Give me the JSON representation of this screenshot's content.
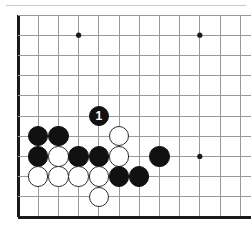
{
  "figure": {
    "kind": "go-board-diagram",
    "width": 251,
    "height": 236,
    "background_color": "#ffffff",
    "top_rule_color": "#c9c9c9"
  },
  "board": {
    "description": "Lower-left corner of a Go board showing a joseki sequence with move 1 marked",
    "origin_x": 18,
    "origin_y": 15,
    "spacing": 20.2,
    "columns": 12,
    "rows": 11,
    "line_color": "#9a9a9a",
    "edge_color": "#1a1a1a",
    "edge_width": 3,
    "line_width": 1,
    "left_edge_column": 0,
    "bottom_edge_row": 10,
    "star_point_color": "#1a1a1a",
    "star_point_radius": 2.6,
    "star_points": [
      {
        "col": 3,
        "row": 1
      },
      {
        "col": 9,
        "row": 1
      },
      {
        "col": 9,
        "row": 7
      }
    ]
  },
  "stones": {
    "radius": 10.2,
    "black_color": "#111111",
    "white_color": "#ffffff",
    "white_outline_color": "#2b2b2b",
    "items": [
      {
        "col": 4,
        "row": 5,
        "color": "black",
        "label": "1",
        "name": "stone-black-move-1"
      },
      {
        "col": 1,
        "row": 6,
        "color": "black",
        "label": "",
        "name": "stone-black-c6"
      },
      {
        "col": 2,
        "row": 6,
        "color": "black",
        "label": "",
        "name": "stone-black-c6b"
      },
      {
        "col": 5,
        "row": 6,
        "color": "white",
        "label": "",
        "name": "stone-white-f6"
      },
      {
        "col": 1,
        "row": 7,
        "color": "black",
        "label": "",
        "name": "stone-black-b7"
      },
      {
        "col": 2,
        "row": 7,
        "color": "white",
        "label": "",
        "name": "stone-white-c7"
      },
      {
        "col": 3,
        "row": 7,
        "color": "black",
        "label": "",
        "name": "stone-black-d7"
      },
      {
        "col": 4,
        "row": 7,
        "color": "black",
        "label": "",
        "name": "stone-black-e7"
      },
      {
        "col": 5,
        "row": 7,
        "color": "white",
        "label": "",
        "name": "stone-white-f7"
      },
      {
        "col": 7,
        "row": 7,
        "color": "black",
        "label": "",
        "name": "stone-black-h7"
      },
      {
        "col": 1,
        "row": 8,
        "color": "white",
        "label": "",
        "name": "stone-white-b8"
      },
      {
        "col": 2,
        "row": 8,
        "color": "white",
        "label": "",
        "name": "stone-white-c8"
      },
      {
        "col": 3,
        "row": 8,
        "color": "white",
        "label": "",
        "name": "stone-white-d8"
      },
      {
        "col": 4,
        "row": 8,
        "color": "white",
        "label": "",
        "name": "stone-white-e8"
      },
      {
        "col": 5,
        "row": 8,
        "color": "black",
        "label": "",
        "name": "stone-black-f8"
      },
      {
        "col": 6,
        "row": 8,
        "color": "black",
        "label": "",
        "name": "stone-black-g8"
      },
      {
        "col": 4,
        "row": 9,
        "color": "white",
        "label": "",
        "name": "stone-white-e9"
      }
    ]
  }
}
